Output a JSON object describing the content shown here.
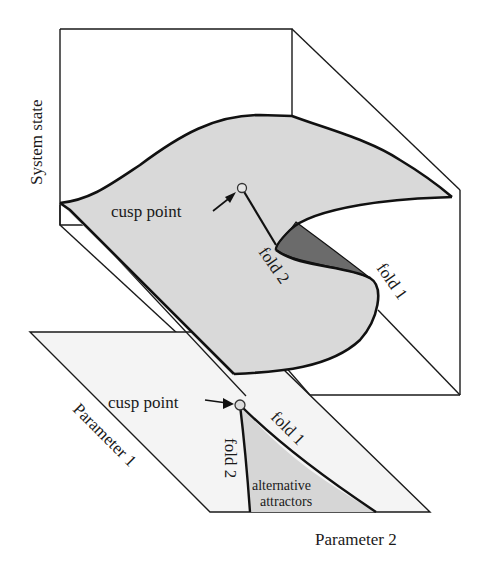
{
  "figure": {
    "type": "cusp catastrophe diagram",
    "colors": {
      "surface_fill": "#d9d9d9",
      "underside_fill": "#6e6e6e",
      "base_plane_fill": "#f2f2f2",
      "bistable_region_fill": "#d6d6d6",
      "line": "#1a1a1a",
      "background": "#ffffff"
    }
  },
  "axes": {
    "vertical_label": "System state",
    "depth_label": "Parameter 1",
    "horizontal_label": "Parameter 2"
  },
  "surface": {
    "cusp_label": "cusp point",
    "fold1_label": "fold 1",
    "fold2_label": "fold 2"
  },
  "base_plane": {
    "cusp_label": "cusp point",
    "fold1_label": "fold 1",
    "fold2_label": "fold 2",
    "region_label_line1": "alternative",
    "region_label_line2": "attractors"
  }
}
